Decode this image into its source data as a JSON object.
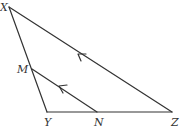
{
  "diagram": {
    "type": "triangle-with-parallel-segment",
    "stroke_color": "#333333",
    "points": {
      "X": {
        "label": "X",
        "x": 9,
        "y": 7
      },
      "M": {
        "label": "M",
        "x": 32,
        "y": 69
      },
      "Y": {
        "label": "Y",
        "x": 47,
        "y": 112
      },
      "N": {
        "label": "N",
        "x": 97,
        "y": 112
      },
      "Z": {
        "label": "Z",
        "x": 172,
        "y": 112
      }
    },
    "segments": [
      {
        "from": "X",
        "to": "Y"
      },
      {
        "from": "Y",
        "to": "Z"
      },
      {
        "from": "X",
        "to": "Z",
        "arrow": true
      },
      {
        "from": "M",
        "to": "N",
        "arrow": true
      }
    ],
    "annotations": {
      "parallel_marks": "MN ∥ XZ (single arrow on each)"
    }
  }
}
